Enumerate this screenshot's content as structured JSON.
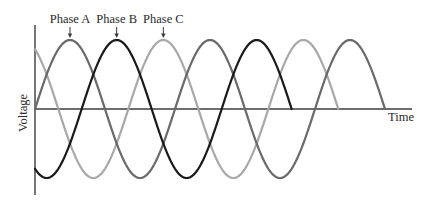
{
  "chart_data": {
    "type": "line",
    "title": "",
    "xlabel": "Time",
    "ylabel": "Voltage",
    "grid": false,
    "legend": "none (series labelled by annotations with arrows)",
    "x_units": "electrical degrees (not shown on axis)",
    "x_range": [
      0,
      972
    ],
    "ylim": [
      -1.22,
      1.22
    ],
    "function": "V = amplitude * sin(x - phase_shift)",
    "series": [
      {
        "name": "Phase A",
        "amplitude": 1,
        "phase_shift_deg": 0,
        "x_start": 0,
        "x_end": 900,
        "color": "#6a6a6a",
        "peaks_x": [
          90,
          450,
          810
        ]
      },
      {
        "name": "Phase B",
        "amplitude": 1,
        "phase_shift_deg": 120,
        "x_start": 0,
        "x_end": 660,
        "color": "#1a1a1a",
        "peaks_x": [
          210,
          570
        ]
      },
      {
        "name": "Phase C",
        "amplitude": 1,
        "phase_shift_deg": 240,
        "x_start": 0,
        "x_end": 780,
        "color": "#a8a8a8",
        "peaks_x": [
          330,
          690
        ]
      }
    ],
    "annotations": [
      {
        "text": "Phase A",
        "x": 90,
        "arrow": "down-to-peak"
      },
      {
        "text": "Phase B",
        "x": 210,
        "arrow": "down-to-peak"
      },
      {
        "text": "Phase C",
        "x": 330,
        "arrow": "down-to-peak"
      }
    ]
  },
  "layout": {
    "origin_px": [
      35,
      109
    ],
    "px_per_unit_x": 0.38889,
    "px_per_unit_y": 69,
    "y_axis_top_px": 25,
    "y_axis_bottom_px": 195,
    "x_axis_end_px": 412
  }
}
